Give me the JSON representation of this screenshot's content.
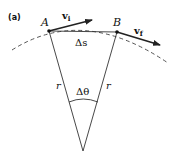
{
  "panel_label": "(a)",
  "points": {
    "A": {
      "label": "A"
    },
    "B": {
      "label": "B"
    }
  },
  "vectors": {
    "vi": {
      "label_main": "v",
      "label_sub": "i"
    },
    "vf": {
      "label_main": "v",
      "label_sub": "f"
    }
  },
  "chord_label": "Δs",
  "radius_left_label": "r",
  "radius_right_label": "r",
  "angle_label": "Δθ",
  "colors": {
    "line": "#333333",
    "dash": "#555555"
  }
}
